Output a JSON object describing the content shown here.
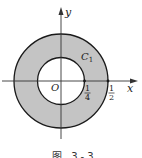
{
  "figure": {
    "caption": "图 3-3",
    "axes": {
      "x_label": "x",
      "y_label": "y",
      "origin_label": "O"
    },
    "curve_label": "C",
    "curve_subscript": "1",
    "ticks": [
      {
        "num": "1",
        "den": "4"
      },
      {
        "num": "1",
        "den": "2"
      }
    ],
    "colors": {
      "annulus_fill": "#c4c4c4",
      "stroke": "#1a1a1a",
      "background": "#ffffff"
    }
  }
}
